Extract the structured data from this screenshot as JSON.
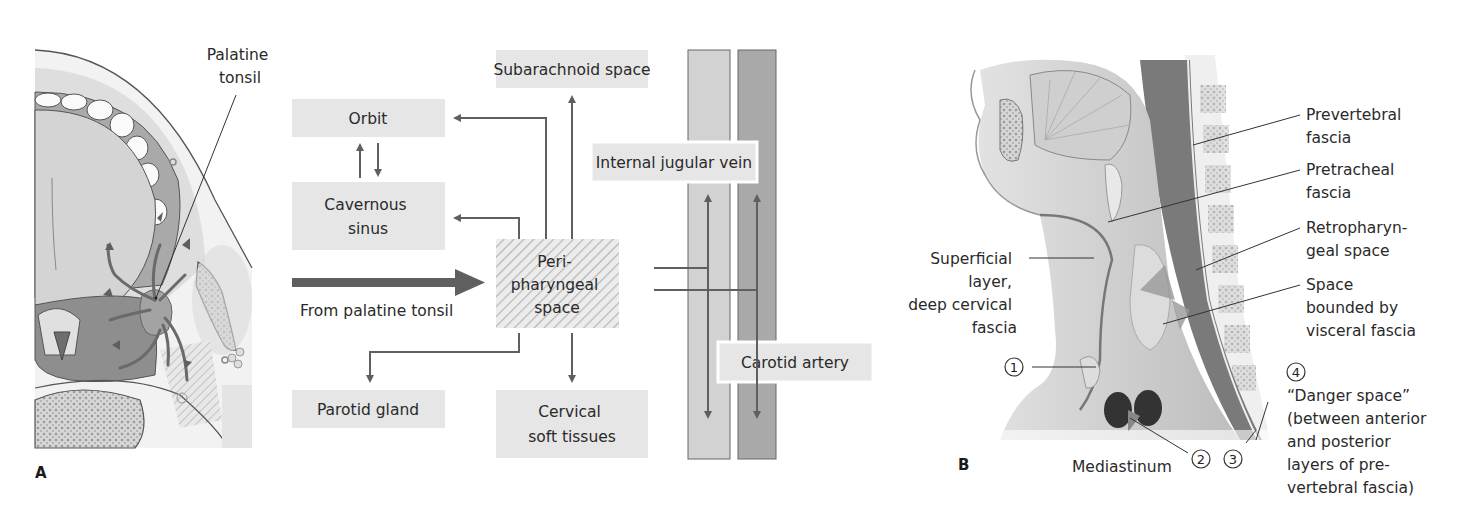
{
  "panel_a": {
    "letter": "A",
    "tonsil_label": [
      "Palatine",
      "tonsil"
    ],
    "flow": {
      "boxes": {
        "orbit": "Orbit",
        "cavernous_sinus": [
          "Cavernous",
          "sinus"
        ],
        "subarachnoid": "Subarachnoid space",
        "internal_jugular": "Internal jugular vein",
        "parapharyngeal": [
          "Peri-",
          "pharyngeal",
          "space"
        ],
        "parotid": "Parotid gland",
        "cervical": [
          "Cervical",
          "soft tissues"
        ],
        "carotid": "Carotid artery"
      },
      "source_label": "From palatine tonsil"
    }
  },
  "panel_b": {
    "letter": "B",
    "labels": {
      "prevertebral": [
        "Prevertebral",
        "fascia"
      ],
      "pretracheal": [
        "Pretracheal",
        "fascia"
      ],
      "retropharyngeal": [
        "Retropharyn-",
        "geal space"
      ],
      "visceral": [
        "Space",
        "bounded by",
        "visceral fascia"
      ],
      "superficial": [
        "Superficial",
        "layer,",
        "deep cervical",
        "fascia"
      ],
      "mediastinum": "Mediastinum",
      "danger": [
        "“Danger space”",
        "(between anterior",
        "and posterior",
        "layers of pre-",
        "vertebral fascia)"
      ]
    },
    "markers": [
      "1",
      "2",
      "3",
      "4"
    ]
  },
  "colors": {
    "box_fill": "#e6e6e6",
    "arrow": "#5f5f5f",
    "vein": "#d2d2d2",
    "artery": "#a9a9a9"
  }
}
